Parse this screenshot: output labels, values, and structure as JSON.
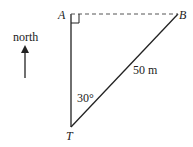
{
  "diagram": {
    "labels": {
      "A": "A",
      "B": "B",
      "T": "T",
      "north": "north",
      "distance": "50 m",
      "angle": "30°"
    },
    "colors": {
      "line": "#222222",
      "dashed": "#555555"
    }
  }
}
